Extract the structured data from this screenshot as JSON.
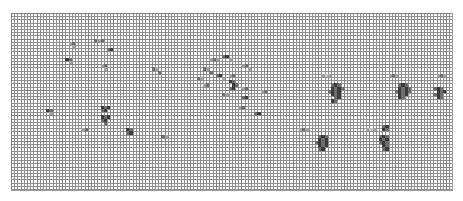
{
  "app": {
    "name": "spreadsheet-grid-view",
    "zoom_level": "minimum",
    "title": ""
  },
  "sheet": {
    "name": "worksheet-canvas",
    "cell_pitch_px": 3.2,
    "columns": 138,
    "rows": 55,
    "gridline_color": "#8e8e8e",
    "major_gridline_color": "#787878",
    "background_color": "#ffffff",
    "border_color": "#9a9a9a",
    "fill_colors": {
      "darkest": "#3b3b3b",
      "dark": "#6d6d6d",
      "mid": "#a2a2a2",
      "light": "#c4c4c4"
    }
  },
  "chart_data": {
    "type": "heatmap",
    "title": "",
    "xlabel": "",
    "ylabel": "",
    "grid": true,
    "legend_position": "none",
    "note": "Filled cell coordinates as [column, row, intensity_class] where intensity 1=darkest .. 4=lightest",
    "columns": 138,
    "rows": 55,
    "filled_cells": [
      [
        26,
        8,
        2
      ],
      [
        27,
        8,
        3
      ],
      [
        28,
        8,
        2
      ],
      [
        30,
        11,
        2
      ],
      [
        31,
        11,
        1
      ],
      [
        18,
        9,
        3
      ],
      [
        19,
        9,
        2
      ],
      [
        19,
        10,
        3
      ],
      [
        17,
        14,
        1
      ],
      [
        18,
        14,
        2
      ],
      [
        18,
        15,
        3
      ],
      [
        62,
        14,
        3
      ],
      [
        63,
        14,
        2
      ],
      [
        64,
        14,
        3
      ],
      [
        66,
        13,
        2
      ],
      [
        67,
        13,
        1
      ],
      [
        68,
        14,
        3
      ],
      [
        72,
        16,
        3
      ],
      [
        73,
        16,
        2
      ],
      [
        74,
        17,
        3
      ],
      [
        60,
        17,
        2
      ],
      [
        61,
        17,
        3
      ],
      [
        62,
        18,
        2
      ],
      [
        64,
        19,
        2
      ],
      [
        65,
        19,
        1
      ],
      [
        66,
        20,
        3
      ],
      [
        68,
        19,
        3
      ],
      [
        69,
        19,
        2
      ],
      [
        44,
        17,
        2
      ],
      [
        45,
        17,
        3
      ],
      [
        46,
        18,
        2
      ],
      [
        28,
        16,
        3
      ],
      [
        29,
        16,
        2
      ],
      [
        29,
        17,
        3
      ],
      [
        58,
        20,
        2
      ],
      [
        59,
        20,
        3
      ],
      [
        68,
        21,
        1
      ],
      [
        69,
        21,
        2
      ],
      [
        69,
        22,
        1
      ],
      [
        70,
        22,
        2
      ],
      [
        68,
        23,
        2
      ],
      [
        69,
        23,
        1
      ],
      [
        72,
        23,
        3
      ],
      [
        73,
        23,
        2
      ],
      [
        60,
        22,
        3
      ],
      [
        61,
        22,
        2
      ],
      [
        66,
        25,
        2
      ],
      [
        67,
        25,
        3
      ],
      [
        72,
        26,
        2
      ],
      [
        73,
        26,
        1
      ],
      [
        78,
        24,
        3
      ],
      [
        79,
        24,
        2
      ],
      [
        97,
        19,
        3
      ],
      [
        98,
        19,
        4
      ],
      [
        99,
        19,
        3
      ],
      [
        100,
        22,
        2
      ],
      [
        101,
        22,
        1
      ],
      [
        102,
        22,
        2
      ],
      [
        100,
        23,
        1
      ],
      [
        101,
        23,
        2
      ],
      [
        102,
        23,
        1
      ],
      [
        103,
        23,
        2
      ],
      [
        99,
        24,
        2
      ],
      [
        100,
        24,
        1
      ],
      [
        101,
        24,
        2
      ],
      [
        102,
        24,
        1
      ],
      [
        100,
        25,
        1
      ],
      [
        101,
        25,
        2
      ],
      [
        102,
        25,
        1
      ],
      [
        101,
        26,
        2
      ],
      [
        102,
        26,
        1
      ],
      [
        100,
        27,
        1
      ],
      [
        101,
        27,
        2
      ],
      [
        118,
        19,
        3
      ],
      [
        119,
        19,
        2
      ],
      [
        120,
        19,
        3
      ],
      [
        121,
        22,
        2
      ],
      [
        122,
        22,
        1
      ],
      [
        123,
        22,
        2
      ],
      [
        121,
        23,
        1
      ],
      [
        122,
        23,
        2
      ],
      [
        123,
        23,
        1
      ],
      [
        124,
        23,
        2
      ],
      [
        120,
        24,
        2
      ],
      [
        121,
        24,
        1
      ],
      [
        122,
        24,
        2
      ],
      [
        123,
        24,
        1
      ],
      [
        124,
        24,
        2
      ],
      [
        121,
        25,
        1
      ],
      [
        122,
        25,
        2
      ],
      [
        123,
        25,
        1
      ],
      [
        122,
        26,
        2
      ],
      [
        121,
        26,
        1
      ],
      [
        133,
        19,
        3
      ],
      [
        134,
        19,
        2
      ],
      [
        135,
        19,
        3
      ],
      [
        132,
        23,
        2
      ],
      [
        133,
        23,
        1
      ],
      [
        134,
        23,
        2
      ],
      [
        133,
        24,
        1
      ],
      [
        134,
        24,
        2
      ],
      [
        135,
        24,
        1
      ],
      [
        132,
        25,
        2
      ],
      [
        133,
        25,
        1
      ],
      [
        134,
        25,
        2
      ],
      [
        133,
        26,
        1
      ],
      [
        134,
        26,
        2
      ],
      [
        11,
        30,
        1
      ],
      [
        12,
        30,
        2
      ],
      [
        12,
        31,
        3
      ],
      [
        28,
        29,
        1
      ],
      [
        29,
        29,
        2
      ],
      [
        30,
        29,
        1
      ],
      [
        28,
        30,
        2
      ],
      [
        29,
        30,
        1
      ],
      [
        28,
        32,
        1
      ],
      [
        29,
        32,
        2
      ],
      [
        30,
        32,
        1
      ],
      [
        28,
        33,
        2
      ],
      [
        29,
        33,
        1
      ],
      [
        29,
        34,
        2
      ],
      [
        22,
        36,
        3
      ],
      [
        23,
        36,
        2
      ],
      [
        36,
        36,
        1
      ],
      [
        37,
        36,
        2
      ],
      [
        36,
        37,
        2
      ],
      [
        37,
        37,
        1
      ],
      [
        47,
        38,
        2
      ],
      [
        48,
        38,
        3
      ],
      [
        71,
        29,
        3
      ],
      [
        72,
        29,
        2
      ],
      [
        76,
        31,
        2
      ],
      [
        77,
        31,
        1
      ],
      [
        90,
        36,
        3
      ],
      [
        91,
        36,
        2
      ],
      [
        92,
        36,
        3
      ],
      [
        96,
        38,
        2
      ],
      [
        97,
        38,
        1
      ],
      [
        98,
        38,
        2
      ],
      [
        96,
        39,
        1
      ],
      [
        97,
        39,
        2
      ],
      [
        98,
        39,
        1
      ],
      [
        95,
        40,
        2
      ],
      [
        96,
        40,
        1
      ],
      [
        97,
        40,
        2
      ],
      [
        98,
        40,
        1
      ],
      [
        96,
        41,
        1
      ],
      [
        97,
        41,
        2
      ],
      [
        98,
        41,
        1
      ],
      [
        96,
        42,
        2
      ],
      [
        97,
        42,
        1
      ],
      [
        111,
        36,
        3
      ],
      [
        112,
        36,
        4
      ],
      [
        113,
        36,
        3
      ],
      [
        116,
        35,
        2
      ],
      [
        117,
        35,
        1
      ],
      [
        116,
        36,
        1
      ],
      [
        117,
        36,
        2
      ],
      [
        115,
        38,
        2
      ],
      [
        116,
        38,
        1
      ],
      [
        117,
        38,
        2
      ],
      [
        115,
        39,
        1
      ],
      [
        116,
        39,
        2
      ],
      [
        117,
        39,
        1
      ],
      [
        115,
        40,
        2
      ],
      [
        116,
        40,
        1
      ],
      [
        117,
        40,
        2
      ],
      [
        116,
        41,
        1
      ],
      [
        117,
        41,
        2
      ],
      [
        116,
        42,
        2
      ],
      [
        117,
        42,
        1
      ]
    ]
  }
}
